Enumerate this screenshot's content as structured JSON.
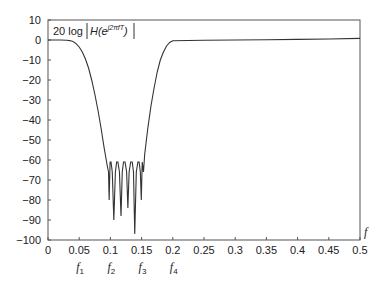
{
  "chart_data": {
    "type": "line",
    "title": "",
    "annotation": {
      "prefix": "20 log",
      "func": "H(",
      "base": "e",
      "exponent": "j2πfT",
      "suffix": ")"
    },
    "xlabel": "f",
    "ylabel": "",
    "xlim": [
      0,
      0.5
    ],
    "ylim": [
      -100,
      10
    ],
    "grid": false,
    "legend": null,
    "x_ticks": [
      0,
      0.05,
      0.1,
      0.15,
      0.2,
      0.25,
      0.3,
      0.35,
      0.4,
      0.45,
      0.5
    ],
    "x_tick_labels": [
      "0",
      "0.05",
      "0.1",
      "0.15",
      "0.2",
      "0.25",
      "0.3",
      "0.35",
      "0.4",
      "0.45",
      "0.5"
    ],
    "y_ticks": [
      10,
      0,
      -10,
      -20,
      -30,
      -40,
      -50,
      -60,
      -70,
      -80,
      -90,
      -100
    ],
    "y_tick_labels": [
      "10",
      "0",
      "−10",
      "−20",
      "−30",
      "−40",
      "−50",
      "−60",
      "−70",
      "−80",
      "−90",
      "−100"
    ],
    "band_edges": [
      {
        "name": "f",
        "sub": "1",
        "x": 0.05
      },
      {
        "name": "f",
        "sub": "2",
        "x": 0.1
      },
      {
        "name": "f",
        "sub": "3",
        "x": 0.15
      },
      {
        "name": "f",
        "sub": "4",
        "x": 0.2
      }
    ],
    "series": [
      {
        "name": "20 log |H(e^{j2πfT})|",
        "x": [
          0,
          0.02,
          0.03,
          0.035,
          0.04,
          0.045,
          0.05,
          0.055,
          0.06,
          0.065,
          0.07,
          0.075,
          0.08,
          0.085,
          0.09,
          0.095,
          0.097,
          0.098,
          0.0995,
          0.101,
          0.103,
          0.1055,
          0.108,
          0.11,
          0.112,
          0.1145,
          0.117,
          0.119,
          0.121,
          0.1235,
          0.126,
          0.128,
          0.13,
          0.1325,
          0.135,
          0.137,
          0.139,
          0.1415,
          0.144,
          0.146,
          0.148,
          0.1495,
          0.151,
          0.153,
          0.155,
          0.16,
          0.165,
          0.17,
          0.175,
          0.18,
          0.185,
          0.19,
          0.195,
          0.2,
          0.25,
          0.3,
          0.35,
          0.4,
          0.45,
          0.5
        ],
        "y": [
          0,
          0,
          -0.1,
          -0.3,
          -0.8,
          -1.8,
          -3.5,
          -6,
          -9.5,
          -14,
          -20,
          -27,
          -35,
          -44,
          -54,
          -63,
          -66,
          -80,
          -61,
          -61,
          -66,
          -90,
          -66,
          -61,
          -61,
          -66,
          -88,
          -66,
          -61,
          -61,
          -66,
          -84,
          -66,
          -61,
          -61,
          -66,
          -97,
          -66,
          -61,
          -61,
          -66,
          -80,
          -61,
          -66,
          -57,
          -44,
          -33,
          -24,
          -16,
          -10,
          -6,
          -3,
          -1.2,
          -0.4,
          -0.1,
          0,
          0.1,
          0.3,
          0.5,
          0.8
        ]
      }
    ]
  }
}
